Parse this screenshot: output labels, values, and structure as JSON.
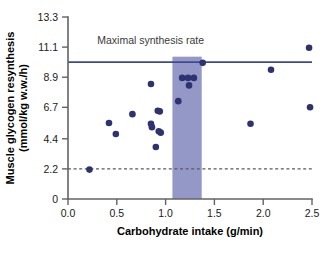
{
  "chart_data": {
    "type": "scatter",
    "title": "",
    "xlabel": "Carbohydrate intake (g/min)",
    "ylabel": "Muscle glycogen resynthesis (mmol/kg w.w./h)",
    "ylabel_line1": "Muscle glycogen resynthesis",
    "ylabel_line2": "(mmol/kg w.w./h)",
    "xlim": [
      0.0,
      2.5
    ],
    "ylim": [
      0,
      13.3
    ],
    "xticks": [
      0.0,
      0.5,
      1.0,
      1.5,
      2.0,
      2.5
    ],
    "xticklabels": [
      "0.0",
      "0.5",
      "1.0",
      "1.5",
      "2.0",
      "2.5"
    ],
    "yticks": [
      0,
      2.2,
      4.4,
      6.7,
      8.9,
      11.1,
      13.3
    ],
    "yticklabels": [
      "0",
      "2.2",
      "4.4",
      "6.7",
      "8.9",
      "11.1",
      "13.3"
    ],
    "grid": false,
    "legend": null,
    "series": [
      {
        "name": "Glycogen resynthesis rate",
        "marker": "circle",
        "color": "#2e3271",
        "points": [
          {
            "x": 0.22,
            "y": 2.15
          },
          {
            "x": 0.42,
            "y": 5.55
          },
          {
            "x": 0.49,
            "y": 4.75
          },
          {
            "x": 0.66,
            "y": 6.2
          },
          {
            "x": 0.85,
            "y": 8.4
          },
          {
            "x": 0.85,
            "y": 5.5
          },
          {
            "x": 0.86,
            "y": 5.25
          },
          {
            "x": 0.9,
            "y": 3.8
          },
          {
            "x": 0.92,
            "y": 6.45
          },
          {
            "x": 0.94,
            "y": 6.4
          },
          {
            "x": 0.93,
            "y": 4.95
          },
          {
            "x": 0.95,
            "y": 4.85
          },
          {
            "x": 1.13,
            "y": 7.15
          },
          {
            "x": 1.17,
            "y": 8.85
          },
          {
            "x": 1.23,
            "y": 8.85
          },
          {
            "x": 1.24,
            "y": 8.3
          },
          {
            "x": 1.29,
            "y": 8.85
          },
          {
            "x": 1.38,
            "y": 9.95
          },
          {
            "x": 1.87,
            "y": 5.5
          },
          {
            "x": 2.08,
            "y": 9.45
          },
          {
            "x": 2.47,
            "y": 11.05
          },
          {
            "x": 2.48,
            "y": 6.7
          }
        ]
      }
    ],
    "annotations": [
      {
        "name": "maximal-synthesis-rate-label",
        "text": "Maximal synthesis rate",
        "x": 0.3,
        "y": 11.35
      }
    ],
    "reference_lines": [
      {
        "name": "maximal-synthesis-rate-line",
        "orientation": "horizontal",
        "value": 10.0,
        "style": "solid",
        "color": "#3f4a96"
      },
      {
        "name": "minimum-threshold-line",
        "orientation": "horizontal",
        "value": 2.2,
        "style": "dashed",
        "color": "#5a5a5a"
      }
    ],
    "shaded_bands": [
      {
        "name": "optimal-intake-band",
        "orientation": "vertical",
        "x_start": 1.07,
        "x_end": 1.37,
        "color": "#8d92c4"
      }
    ]
  }
}
